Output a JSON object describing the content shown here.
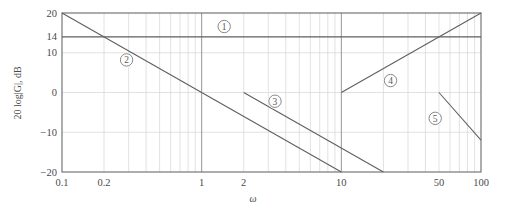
{
  "chart_data": {
    "type": "line",
    "title": "",
    "subtitle": "",
    "xlabel": "ω",
    "ylabel": "20 log|G|, dB",
    "xscale": "log",
    "yscale": "linear",
    "xlim": [
      0.1,
      100
    ],
    "ylim": [
      -20,
      20
    ],
    "grid": true,
    "legend_position": "inline-annotations",
    "x_ticks": [
      {
        "value": 0.1,
        "label": "0.1",
        "major": true
      },
      {
        "value": 0.2,
        "label": "0.2",
        "major": false
      },
      {
        "value": 1,
        "label": "1",
        "major": true
      },
      {
        "value": 2,
        "label": "2",
        "major": false
      },
      {
        "value": 10,
        "label": "10",
        "major": true
      },
      {
        "value": 50,
        "label": "50",
        "major": false
      },
      {
        "value": 100,
        "label": "100",
        "major": true
      }
    ],
    "x_minor_ticks": [
      0.3,
      0.4,
      0.5,
      0.6,
      0.7,
      0.8,
      0.9,
      3,
      4,
      5,
      6,
      7,
      8,
      9,
      20,
      30,
      40,
      60,
      70,
      80,
      90
    ],
    "y_ticks": [
      {
        "value": 20,
        "label": "20"
      },
      {
        "value": 14,
        "label": "14"
      },
      {
        "value": 10,
        "label": "10"
      },
      {
        "value": 0,
        "label": "0"
      },
      {
        "value": -10,
        "label": "−10"
      },
      {
        "value": -20,
        "label": "−20"
      }
    ],
    "series": [
      {
        "name": "1",
        "annotation": "①",
        "annotation_label": "1",
        "description": "constant gain asymptote at 14 dB",
        "slope_db_per_decade": 0,
        "points": [
          {
            "x": 0.1,
            "y": 14
          },
          {
            "x": 100,
            "y": 14
          }
        ],
        "label_position": {
          "x": 1.45,
          "y": 16.6
        }
      },
      {
        "name": "2",
        "annotation": "②",
        "annotation_label": "2",
        "description": "−20 dB/decade asymptote from 20 dB at ω=0.1 to −20 dB at ω=10",
        "slope_db_per_decade": -20,
        "points": [
          {
            "x": 0.1,
            "y": 20
          },
          {
            "x": 10,
            "y": -20
          }
        ],
        "label_position": {
          "x": 0.29,
          "y": 8.2
        }
      },
      {
        "name": "3",
        "annotation": "③",
        "annotation_label": "3",
        "description": "−20 dB/decade asymptote from 0 dB at ω=2 to −20 dB at ω=20",
        "slope_db_per_decade": -20,
        "points": [
          {
            "x": 2,
            "y": 0
          },
          {
            "x": 20,
            "y": -20
          }
        ],
        "label_position": {
          "x": 3.35,
          "y": -2.2
        }
      },
      {
        "name": "4",
        "annotation": "④",
        "annotation_label": "4",
        "description": "+20 dB/decade asymptote from 0 dB at ω=10 to 20 dB at ω=100",
        "slope_db_per_decade": 20,
        "points": [
          {
            "x": 10,
            "y": 0
          },
          {
            "x": 100,
            "y": 20
          }
        ],
        "label_position": {
          "x": 22.5,
          "y": 3.0
        }
      },
      {
        "name": "5",
        "annotation": "⑤",
        "annotation_label": "5",
        "description": "−40 dB/decade asymptote from 0 dB at ω=50 to −12 dB at ω=100",
        "slope_db_per_decade": -40,
        "points": [
          {
            "x": 50,
            "y": 0
          },
          {
            "x": 100,
            "y": -12
          }
        ],
        "label_position": {
          "x": 47.0,
          "y": -6.5
        }
      }
    ],
    "colors": {
      "line": "#5e5e5e",
      "frame": "#6a6a6a",
      "grid_minor": "#d6d6d6",
      "grid_major": "#8a8a8a",
      "text": "#4a4a4a",
      "background": "#ffffff"
    }
  }
}
